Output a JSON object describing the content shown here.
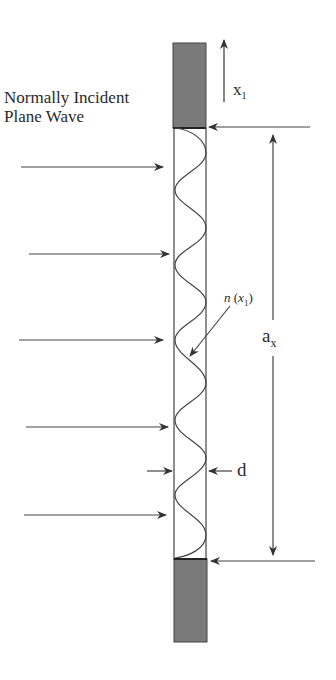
{
  "diagram": {
    "title_line1": "Normally Incident",
    "title_line2": "Plane Wave",
    "axis_label": "x",
    "axis_label_sub": "1",
    "profile_label_fn": "n",
    "profile_label_arg": "x",
    "profile_label_arg_sub": "1",
    "aperture_label": "a",
    "aperture_label_sub": "x",
    "thickness_label": "d",
    "colors": {
      "stroke": "#333333",
      "block_fill": "#7a7a7a",
      "background": "#ffffff"
    },
    "components": {
      "top_block": "opaque-screen-top",
      "bottom_block": "opaque-screen-bottom",
      "grating_region": "phase-grating-with-sinusoidal-index",
      "incident_arrows": 5
    }
  }
}
